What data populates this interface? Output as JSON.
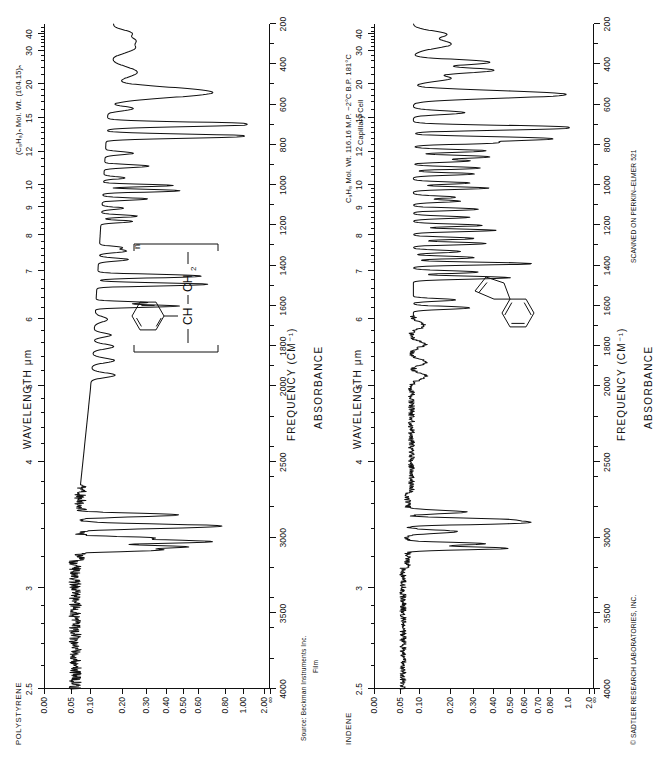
{
  "page": {
    "width": 647,
    "height": 759,
    "background": "#ffffff",
    "ink": "#111111"
  },
  "panels": [
    {
      "id": "polystyrene",
      "name": "POLYSTYRENE",
      "header": "(C₈H₈)ₙ  Mol. Wt. (104.15)ₙ",
      "header2": "",
      "footer1": "Source:  Beckman Instruments Inc.",
      "footer2": "Film",
      "footer_right": "",
      "axis": {
        "x_title": "WAVELENGTH  μm",
        "b_title": "FREQUENCY  (CM⁻¹)",
        "y_title": "ABSORBANCE"
      }
    },
    {
      "id": "indene",
      "name": "INDENE",
      "header": "C₉H₈  Mol. Wt. 116.16  M.P. −2°C  B.P. 181°C",
      "header2": "Capillary Cell",
      "footer1": "",
      "footer2": "",
      "footer_right": "© SADTLER RESEARCH LABORATORIES, INC.",
      "footer_right2": "SCANNED ON PERKIN–ELMER 521",
      "axis": {
        "x_title": "WAVELENGTH  μm",
        "b_title": "FREQUENCY  (CM⁻¹)",
        "y_title": "ABSORBANCE"
      }
    }
  ],
  "chart_data": [
    {
      "type": "line",
      "title": "POLYSTYRENE",
      "subtitle": "(C₈H₈)ₙ  Mol. Wt. (104.15)ₙ",
      "xlabel": "WAVELENGTH  μm",
      "xlabel_secondary": "FREQUENCY  (CM⁻¹)",
      "ylabel": "ABSORBANCE",
      "grid": false,
      "legend": "none",
      "orientation": "rotated-90",
      "sample_form": "Film",
      "source": "Beckman Instruments Inc.",
      "x_axis_top": {
        "name": "wavelength_um",
        "ticks": [
          2.5,
          3,
          4,
          5,
          6,
          7,
          8,
          9,
          10,
          12,
          15,
          20,
          30,
          40
        ],
        "labels": [
          "2.5",
          "3",
          "4",
          "5",
          "6",
          "7",
          "8",
          "9",
          "10",
          "12",
          "15",
          "20",
          "30",
          "40"
        ],
        "range": [
          2.5,
          50
        ]
      },
      "x_axis_bottom": {
        "name": "frequency_cm-1",
        "ticks": [
          4000,
          3500,
          3000,
          2500,
          2000,
          1800,
          1600,
          1400,
          1200,
          1000,
          800,
          600,
          400,
          200
        ],
        "labels": [
          "4000",
          "3500",
          "3000",
          "2500",
          "2000",
          "1800",
          "1600",
          "1400",
          "1200",
          "1000",
          "800",
          "600",
          "400",
          "200"
        ],
        "range": [
          4000,
          200
        ]
      },
      "y_axis": {
        "name": "absorbance",
        "ticks": [
          0.0,
          0.05,
          0.1,
          0.2,
          0.3,
          0.4,
          0.5,
          0.6,
          0.8,
          1.0,
          2.0
        ],
        "labels": [
          "0.00",
          "0.05",
          "0.10",
          "0.20",
          "0.30",
          "0.40",
          "0.50",
          "0.60",
          "0.80",
          "1.00",
          "2.00",
          "∞"
        ],
        "scale": "absorbance (log transmittance)",
        "direction": "0 at top, ∞ at bottom"
      },
      "peaks_cm1": [
        3082,
        3060,
        3026,
        2924,
        2850,
        1944,
        1871,
        1802,
        1745,
        1601,
        1583,
        1493,
        1452,
        1370,
        1328,
        1181,
        1154,
        1069,
        1028,
        906,
        842,
        757,
        698,
        540
      ],
      "annotation_structure": "[-CH-CH₂-]ₙ with pendant phenyl ring"
    },
    {
      "type": "line",
      "title": "INDENE",
      "subtitle": "C₉H₈  Mol. Wt. 116.16  M.P. −2°C  B.P. 181°C",
      "xlabel": "WAVELENGTH  μm",
      "xlabel_secondary": "FREQUENCY  (CM⁻¹)",
      "ylabel": "ABSORBANCE",
      "grid": false,
      "legend": "none",
      "orientation": "rotated-90",
      "sample_form": "Capillary Cell",
      "source": "© SADTLER RESEARCH LABORATORIES, INC.",
      "instrument": "SCANNED ON PERKIN–ELMER 521",
      "x_axis_top": {
        "name": "wavelength_um",
        "ticks": [
          2.5,
          3,
          4,
          5,
          6,
          7,
          8,
          9,
          10,
          12,
          15,
          20,
          30,
          40
        ],
        "labels": [
          "2.5",
          "3",
          "4",
          "5",
          "6",
          "7",
          "8",
          "9",
          "10",
          "12",
          "15",
          "20",
          "30",
          "40"
        ],
        "range": [
          2.5,
          50
        ]
      },
      "x_axis_bottom": {
        "name": "frequency_cm-1",
        "ticks": [
          4000,
          3500,
          3000,
          2500,
          2000,
          1800,
          1600,
          1400,
          1200,
          1000,
          800,
          600,
          400,
          200
        ],
        "labels": [
          "4000",
          "3500",
          "3000",
          "2500",
          "2000",
          "1800",
          "1600",
          "1400",
          "1200",
          "1000",
          "800",
          "600",
          "400",
          "200"
        ],
        "range": [
          4000,
          200
        ]
      },
      "y_axis": {
        "name": "absorbance",
        "ticks": [
          0.0,
          0.05,
          0.1,
          0.2,
          0.3,
          0.4,
          0.5,
          0.6,
          0.7,
          0.8,
          1.0,
          2.0
        ],
        "labels": [
          "0.00",
          "0.05",
          "0.10",
          "0.20",
          "0.30",
          "0.40",
          "0.50",
          "0.60",
          "0.70",
          "0.80",
          "1.0",
          "2.0",
          "∞"
        ],
        "scale": "absorbance (log transmittance)",
        "direction": "0 at top, ∞ at bottom"
      },
      "peaks_cm1": [
        3070,
        3040,
        2900,
        2880,
        1610,
        1570,
        1460,
        1390,
        1360,
        1290,
        1225,
        1200,
        1120,
        1080,
        1015,
        945,
        915,
        860,
        830,
        770,
        715,
        550,
        430,
        390
      ],
      "annotation_structure": "Indene bicyclic (benzene fused cyclopentene)"
    }
  ],
  "ticks": {
    "top_major": [
      "2.5",
      "3",
      "4",
      "5",
      "6",
      "7",
      "8",
      "9",
      "10",
      "12",
      "15",
      "20",
      "30",
      "40"
    ],
    "bottom_major": [
      "4000",
      "3500",
      "3000",
      "2500",
      "2000",
      "1800",
      "1600",
      "1400",
      "1200",
      "1000",
      "800",
      "600",
      "400",
      "200"
    ],
    "abs_left": [
      "0.00",
      "0.05",
      "0.10",
      "0.20",
      "0.30",
      "0.40",
      "0.50",
      "0.60",
      "0.80",
      "1.00",
      "2.00",
      "∞"
    ],
    "abs_right": [
      "0.00",
      "0.05",
      "0.10",
      "0.20",
      "0.30",
      "0.40",
      "0.50",
      "0.60",
      "0.70",
      "0.80",
      "1.0",
      "2.0",
      "∞"
    ]
  }
}
